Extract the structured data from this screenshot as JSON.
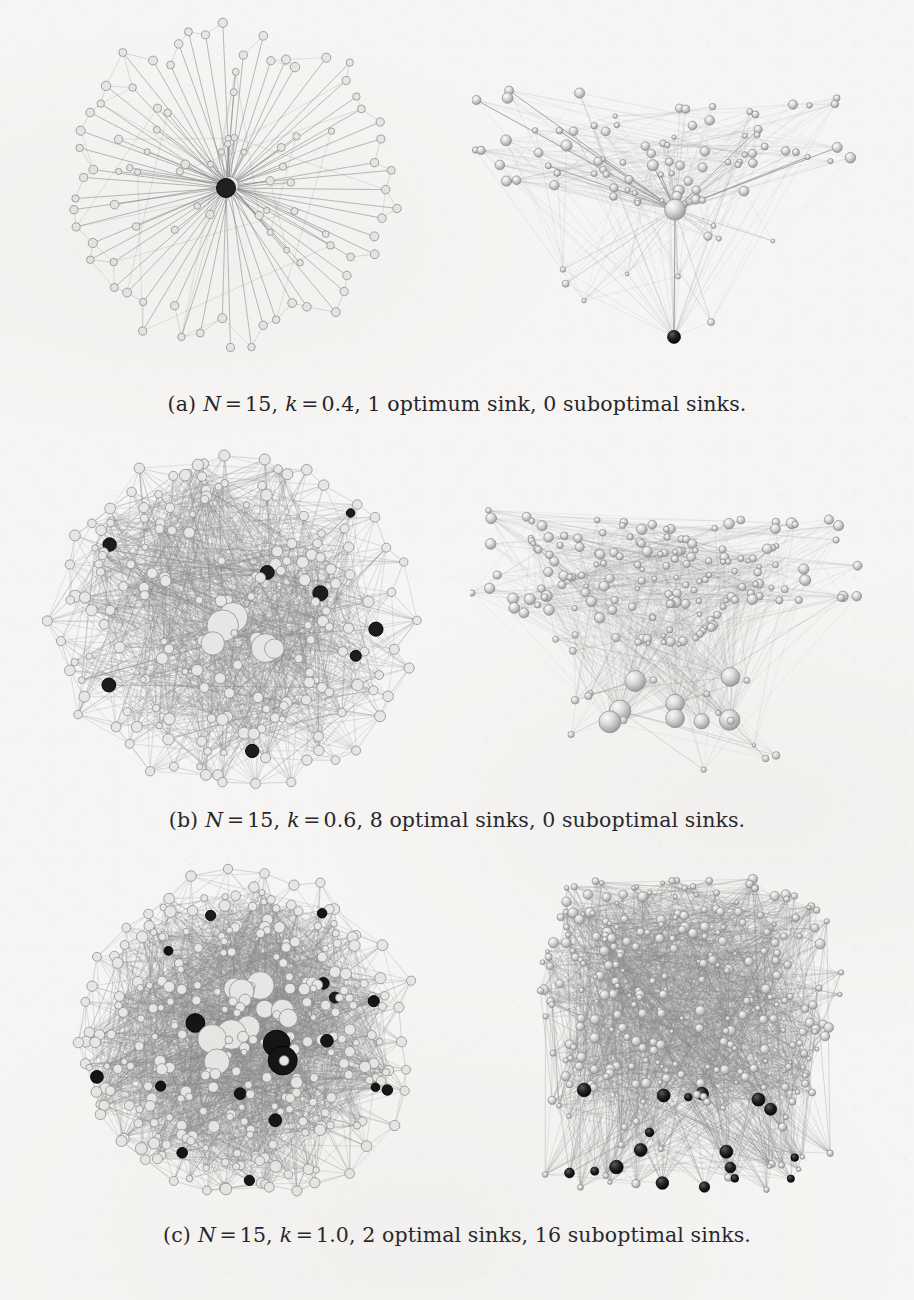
{
  "figure": {
    "kind": "network-graph-figure",
    "background_color": "#f6f5f3",
    "subfigure_count": 3,
    "panels_per_subfigure": 2
  },
  "palette": {
    "paper": "#f6f5f3",
    "edge_gray": "#8d8d8d",
    "edge_faint": "#b9b9b9",
    "node_light": "#e6e6e4",
    "node_mid": "#c9c9c7",
    "node_outline": "#8f8f8f",
    "sink_optimum": "#1d1d1d",
    "sink_suboptimal": "#141414",
    "caption_text": "#26262a"
  },
  "captions": [
    {
      "id": "caption-a",
      "tag": "(a)",
      "n_label": "N",
      "n_eq": "=",
      "n_value": "15,",
      "k_label": "k",
      "k_eq": "=",
      "k_value": "0.4,",
      "sinks_text": "1 optimum sink, 0 suboptimal sinks.",
      "full_text": "(a) N = 15, k = 0.4, 1 optimum sink, 0 suboptimal sinks."
    },
    {
      "id": "caption-b",
      "tag": "(b)",
      "n_label": "N",
      "n_eq": "=",
      "n_value": "15,",
      "k_label": "k",
      "k_eq": "=",
      "k_value": "0.6,",
      "sinks_text": "8 optimal sinks, 0 suboptimal sinks.",
      "full_text": "(b) N = 15, k = 0.6, 8 optimal sinks, 0 suboptimal sinks."
    },
    {
      "id": "caption-c",
      "tag": "(c)",
      "n_label": "N",
      "n_eq": "=",
      "n_value": "15,",
      "k_label": "k",
      "k_eq": "=",
      "k_value": "1.0,",
      "sinks_text": "2 optimal sinks, 16 suboptimal sinks.",
      "full_text": "(c) N = 15, k = 1.0, 2 optimal sinks, 16 suboptimal sinks."
    }
  ],
  "chart_data": {
    "type": "scatter",
    "title": "",
    "xlabel": "",
    "ylabel": "",
    "series": [
      {
        "name": "subfigure-a-2d",
        "panel": "a-left",
        "layout": "radial-hub-spoke",
        "x": 230,
        "y": 205,
        "width": 360,
        "height": 360,
        "node_count": 96,
        "hub_count": 1,
        "edge_density": 0.18,
        "optimum_sinks": 1,
        "suboptimal_sinks": 0,
        "seed": 11,
        "radius_outer": 168,
        "spoke_ring_nodes": 58,
        "inner_ring_nodes": 37
      },
      {
        "name": "subfigure-a-3d",
        "panel": "a-right",
        "layout": "cone-funnel",
        "x": 672,
        "y": 215,
        "width": 400,
        "height": 330,
        "node_count": 96,
        "hub_count": 1,
        "edge_density": 0.3,
        "optimum_sinks": 1,
        "suboptimal_sinks": 0,
        "seed": 23,
        "apex_y": 380,
        "waist_y": 270,
        "canopy_y": 150
      },
      {
        "name": "subfigure-b-2d",
        "panel": "b-left",
        "layout": "dense-disc",
        "x": 232,
        "y": 620,
        "width": 380,
        "height": 360,
        "node_count": 190,
        "hub_count": 14,
        "edge_density": 0.52,
        "optimum_sinks": 8,
        "suboptimal_sinks": 0,
        "seed": 37,
        "radius_outer": 178,
        "spoke_ring_nodes": 40
      },
      {
        "name": "subfigure-b-3d",
        "panel": "b-right",
        "layout": "cone-funnel",
        "x": 675,
        "y": 625,
        "width": 410,
        "height": 350,
        "node_count": 190,
        "hub_count": 14,
        "edge_density": 0.42,
        "optimum_sinks": 8,
        "suboptimal_sinks": 0,
        "seed": 53,
        "apex_y": 760,
        "waist_y": 660,
        "canopy_y": 520
      },
      {
        "name": "subfigure-c-2d",
        "panel": "c-left",
        "layout": "dense-disc",
        "x": 243,
        "y": 1037,
        "width": 380,
        "height": 350,
        "node_count": 300,
        "hub_count": 26,
        "edge_density": 0.7,
        "optimum_sinks": 2,
        "suboptimal_sinks": 16,
        "seed": 71,
        "radius_outer": 172,
        "spoke_ring_nodes": 34
      },
      {
        "name": "subfigure-c-3d",
        "panel": "c-right",
        "layout": "slab-layered",
        "x": 690,
        "y": 1035,
        "width": 330,
        "height": 340,
        "node_count": 300,
        "hub_count": 26,
        "edge_density": 0.66,
        "optimum_sinks": 2,
        "suboptimal_sinks": 16,
        "seed": 89,
        "slab_top_y": 890,
        "slab_bottom_y": 1110,
        "tail_y": 1190
      }
    ],
    "legend": [],
    "grid": false
  },
  "layout": {
    "caption_y": [
      392,
      808,
      1223
    ],
    "row_top": [
      20,
      440,
      860
    ]
  }
}
